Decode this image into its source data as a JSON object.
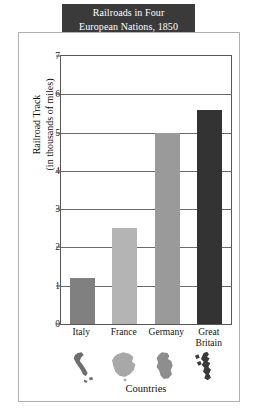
{
  "title": {
    "line1": "Railroads in Four",
    "line2": "European Nations, 1850"
  },
  "chart_data": {
    "type": "bar",
    "title": "Railroads in Four European Nations, 1850",
    "xlabel": "Countries",
    "ylabel": "Railroad Track (in thousands of miles)",
    "ylabel_line1": "Railroad Track",
    "ylabel_line2": "(in thousands of miles)",
    "categories": [
      "Italy",
      "France",
      "Germany",
      "Great Britain"
    ],
    "category_labels": [
      {
        "line1": "Italy",
        "line2": ""
      },
      {
        "line1": "France",
        "line2": ""
      },
      {
        "line1": "Germany",
        "line2": ""
      },
      {
        "line1": "Great",
        "line2": "Britain"
      }
    ],
    "values": [
      1.2,
      2.5,
      5.0,
      5.6
    ],
    "bar_colors": [
      "#808080",
      "#b4b4b4",
      "#9a9a9a",
      "#333333"
    ],
    "ylim": [
      0,
      7
    ],
    "yticks": [
      0,
      1,
      2,
      3,
      4,
      5,
      6,
      7
    ],
    "ytick_labels": [
      "0",
      "1",
      "2",
      "3",
      "4",
      "5",
      "6",
      "7"
    ],
    "grid": true,
    "grid_axis": "y",
    "legend": "none"
  },
  "axis": {
    "x_title": "Countries"
  },
  "colors": {
    "title_background": "#3a3a3a",
    "title_text": "#ffffff",
    "frame_border": "#b0b0b0",
    "plot_border": "#585858",
    "gridline": "#6a6a6a",
    "page_background": "#ffffff"
  },
  "country_shapes": [
    {
      "name": "italy-map-icon",
      "color": "#6e6e6e"
    },
    {
      "name": "france-map-icon",
      "color": "#a8a8a8"
    },
    {
      "name": "germany-map-icon",
      "color": "#8e8e8e"
    },
    {
      "name": "great-britain-map-icon",
      "color": "#3a3a3a"
    }
  ]
}
